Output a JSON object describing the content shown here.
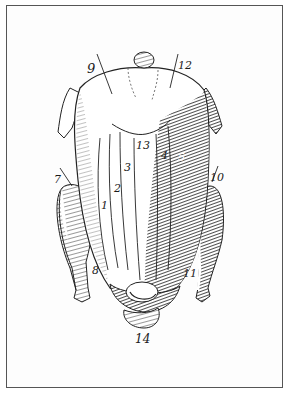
{
  "figure": {
    "style": "engraving",
    "colors": {
      "ink": "#1a1a1a",
      "paper": "#fdfdfd",
      "frame": "#555555",
      "shade": "#3a3a3a"
    },
    "labels": [
      {
        "id": "1",
        "text": "1",
        "x": 101,
        "y": 200
      },
      {
        "id": "2",
        "text": "2",
        "x": 114,
        "y": 183
      },
      {
        "id": "3",
        "text": "3",
        "x": 124,
        "y": 162
      },
      {
        "id": "4",
        "text": "4",
        "x": 161,
        "y": 150
      },
      {
        "id": "5",
        "text": "5",
        "x": 178,
        "y": 152
      },
      {
        "id": "7",
        "text": "7",
        "x": 54,
        "y": 174
      },
      {
        "id": "8",
        "text": "8",
        "x": 92,
        "y": 265
      },
      {
        "id": "9",
        "text": "9",
        "x": 87,
        "y": 62
      },
      {
        "id": "10",
        "text": "10",
        "x": 210,
        "y": 172
      },
      {
        "id": "11",
        "text": "11",
        "x": 183,
        "y": 268
      },
      {
        "id": "12",
        "text": "12",
        "x": 178,
        "y": 60
      },
      {
        "id": "13",
        "text": "13",
        "x": 136,
        "y": 140
      },
      {
        "id": "14",
        "text": "14",
        "x": 135,
        "y": 333
      }
    ]
  }
}
